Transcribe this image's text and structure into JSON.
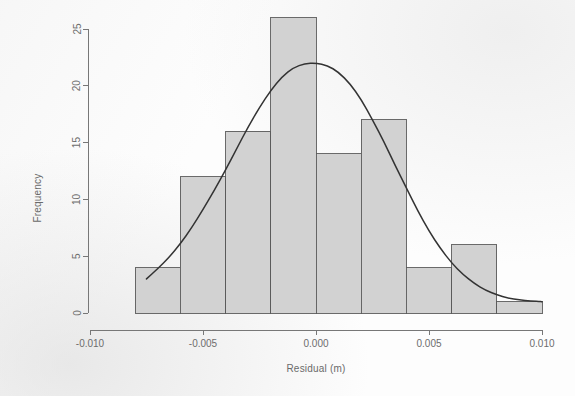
{
  "chart_data": {
    "type": "bar",
    "title": "",
    "subtitle": "",
    "xlabel": "Residual (m)",
    "ylabel": "Frequency",
    "xlim": [
      -0.01,
      0.01
    ],
    "ylim": [
      0,
      26
    ],
    "grid": false,
    "legend": null,
    "bin_width": 0.002,
    "bin_edges": [
      -0.008,
      -0.006,
      -0.004,
      -0.002,
      0.0,
      0.002,
      0.004,
      0.006,
      0.008,
      0.01
    ],
    "categories": [
      "-0.008 to -0.006",
      "-0.006 to -0.004",
      "-0.004 to -0.002",
      "-0.002 to 0.000",
      "0.000 to 0.002",
      "0.002 to 0.004",
      "0.004 to 0.006",
      "0.006 to 0.008",
      "0.008 to 0.010"
    ],
    "values": [
      4,
      12,
      16,
      26,
      14,
      17,
      4,
      6,
      1
    ],
    "bar_fill_color": "#d2d2d2",
    "bar_border_color": "#5a5a5a",
    "overlay_curve": {
      "name": "normal density curve",
      "color": "#333333",
      "peak_value": 22,
      "mean": 0.0,
      "sd": 0.0033,
      "x_start": -0.0075,
      "x_end": 0.01,
      "points": [
        {
          "x": -0.0075,
          "y": 3.0
        },
        {
          "x": -0.007,
          "y": 3.9
        },
        {
          "x": -0.0065,
          "y": 4.9
        },
        {
          "x": -0.006,
          "y": 6.1
        },
        {
          "x": -0.0055,
          "y": 7.5
        },
        {
          "x": -0.005,
          "y": 9.1
        },
        {
          "x": -0.0045,
          "y": 10.8
        },
        {
          "x": -0.004,
          "y": 12.6
        },
        {
          "x": -0.0035,
          "y": 14.5
        },
        {
          "x": -0.003,
          "y": 16.4
        },
        {
          "x": -0.0025,
          "y": 18.1
        },
        {
          "x": -0.002,
          "y": 19.6
        },
        {
          "x": -0.0015,
          "y": 20.8
        },
        {
          "x": -0.001,
          "y": 21.6
        },
        {
          "x": -0.0005,
          "y": 21.95
        },
        {
          "x": 0.0,
          "y": 22.0
        },
        {
          "x": 0.0005,
          "y": 21.8
        },
        {
          "x": 0.001,
          "y": 21.2
        },
        {
          "x": 0.0015,
          "y": 20.2
        },
        {
          "x": 0.002,
          "y": 18.8
        },
        {
          "x": 0.0025,
          "y": 17.0
        },
        {
          "x": 0.003,
          "y": 15.1
        },
        {
          "x": 0.0035,
          "y": 13.0
        },
        {
          "x": 0.004,
          "y": 11.0
        },
        {
          "x": 0.0045,
          "y": 9.0
        },
        {
          "x": 0.005,
          "y": 7.2
        },
        {
          "x": 0.0055,
          "y": 5.7
        },
        {
          "x": 0.006,
          "y": 4.4
        },
        {
          "x": 0.0065,
          "y": 3.4
        },
        {
          "x": 0.007,
          "y": 2.6
        },
        {
          "x": 0.0075,
          "y": 2.0
        },
        {
          "x": 0.008,
          "y": 1.6
        },
        {
          "x": 0.0085,
          "y": 1.3
        },
        {
          "x": 0.009,
          "y": 1.15
        },
        {
          "x": 0.0095,
          "y": 1.05
        },
        {
          "x": 0.01,
          "y": 1.0
        }
      ]
    },
    "xticks": [
      {
        "value": -0.01,
        "label": "-0.010"
      },
      {
        "value": -0.005,
        "label": "-0.005"
      },
      {
        "value": 0.0,
        "label": "0.000"
      },
      {
        "value": 0.005,
        "label": "0.005"
      },
      {
        "value": 0.01,
        "label": "0.010"
      }
    ],
    "yticks": [
      {
        "value": 0,
        "label": "0"
      },
      {
        "value": 5,
        "label": "5"
      },
      {
        "value": 10,
        "label": "10"
      },
      {
        "value": 15,
        "label": "15"
      },
      {
        "value": 20,
        "label": "20"
      },
      {
        "value": 25,
        "label": "25"
      }
    ]
  }
}
